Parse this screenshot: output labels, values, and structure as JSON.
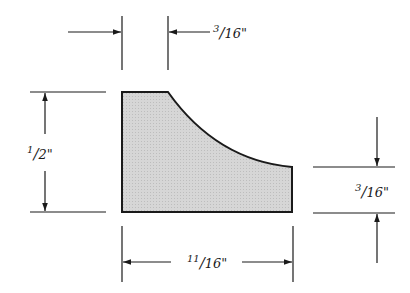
{
  "diagram": {
    "type": "dimensioned profile drawing",
    "shape": {
      "fill_color": "#d4d4d4",
      "stroke_color": "#1a1a1a",
      "description": "profile with flat top, concave curve down to short right edge"
    },
    "dimensions": [
      {
        "id": "top_flat_width",
        "numerator": "3",
        "denominator": "16",
        "unit": "\"",
        "text": "3/16\""
      },
      {
        "id": "left_height",
        "numerator": "1",
        "denominator": "2",
        "unit": "\"",
        "text": "1/2\""
      },
      {
        "id": "right_height",
        "numerator": "3",
        "denominator": "16",
        "unit": "\"",
        "text": "3/16\""
      },
      {
        "id": "bottom_width",
        "numerator": "11",
        "denominator": "16",
        "unit": "\"",
        "text": "11/16\""
      }
    ]
  }
}
